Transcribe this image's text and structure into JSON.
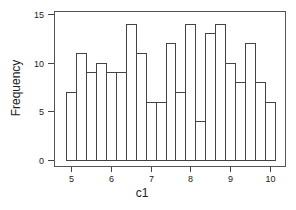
{
  "chart_data": {
    "type": "bar",
    "subtype": "histogram",
    "title": "",
    "xlabel": "c1",
    "ylabel": "Frequency",
    "x_ticks": [
      "5",
      "6",
      "7",
      "8",
      "9",
      "10"
    ],
    "y_ticks": [
      "0",
      "5",
      "10",
      "15"
    ],
    "xlim": [
      4.75,
      10.25
    ],
    "ylim": [
      0,
      15
    ],
    "bin_start": 4.875,
    "bin_width": 0.25,
    "values": [
      7,
      11,
      9,
      10,
      9,
      9,
      14,
      11,
      6,
      6,
      12,
      7,
      14,
      4,
      13,
      14,
      10,
      8,
      12,
      8,
      6
    ],
    "grid": false,
    "legend": null
  }
}
